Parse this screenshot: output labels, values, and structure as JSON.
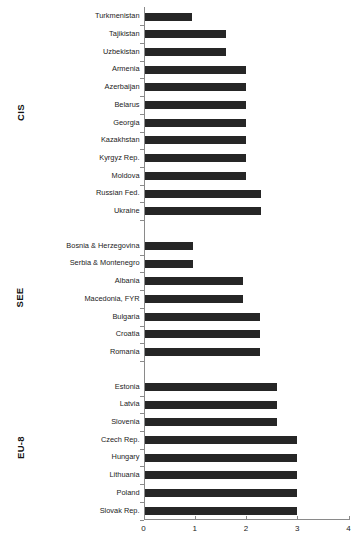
{
  "chart_data": {
    "type": "bar",
    "orientation": "horizontal",
    "title": "",
    "subtitle": "",
    "xlabel": "",
    "ylabel": "",
    "xlim": [
      0,
      4
    ],
    "xticks": [
      0,
      1,
      2,
      3,
      4
    ],
    "xtick_labels": [
      "0",
      "1",
      "2",
      "3",
      "4"
    ],
    "grid": false,
    "legend": "none",
    "bar_color": "#262626",
    "axis_color": "#8a8a8a",
    "groups": [
      {
        "name": "CIS",
        "categories": [
          "Turkmenistan",
          "Tajikistan",
          "Uzbekistan",
          "Armenia",
          "Azerbaijan",
          "Belarus",
          "Georgia",
          "Kazakhstan",
          "Kyrgyz Rep.",
          "Moldova",
          "Russian Fed.",
          "Ukraine"
        ],
        "values": [
          0.95,
          1.6,
          1.6,
          2.0,
          2.0,
          2.0,
          2.0,
          2.0,
          2.0,
          2.0,
          2.3,
          2.3
        ]
      },
      {
        "name": "SEE",
        "categories": [
          "Bosnia & Herzegovina",
          "Serbia & Montenegro",
          "Albania",
          "Macedonia, FYR",
          "Bulgaria",
          "Croatia",
          "Romania"
        ],
        "values": [
          0.97,
          0.97,
          1.95,
          1.95,
          2.28,
          2.28,
          2.28
        ]
      },
      {
        "name": "EU-8",
        "categories": [
          "Estonia",
          "Latvia",
          "Slovenia",
          "Czech Rep.",
          "Hungary",
          "Lithuania",
          "Poland",
          "Slovak Rep."
        ],
        "values": [
          2.6,
          2.6,
          2.6,
          3.0,
          3.0,
          3.0,
          3.0,
          3.0
        ]
      }
    ]
  }
}
